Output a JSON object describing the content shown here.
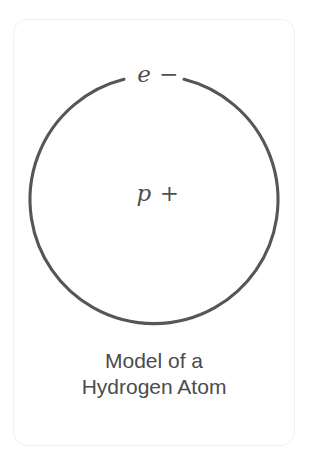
{
  "figure": {
    "kind": "scientific-diagram",
    "background_color": "#ffffff",
    "card": {
      "border_color": "#f1f1f1",
      "corner_radius_px": 14
    },
    "diagram": {
      "name": "bohr-model-hydrogen",
      "orbit": {
        "stroke_color": "#565656",
        "stroke_width_px": 3,
        "center_x": 154,
        "center_y": 200,
        "radius": 124,
        "gap_top_for_label": true
      },
      "labels": {
        "electron": "e −",
        "proton": "p +"
      },
      "label_color": "#4f4f4f"
    },
    "caption": {
      "line1": "Model of a",
      "line2": "Hydrogen Atom",
      "color": "#4b4b4b"
    }
  }
}
